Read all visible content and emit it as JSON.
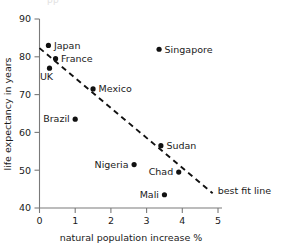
{
  "figure": {
    "ghost_text": "pp",
    "background": "#ffffff",
    "marker_color": "#111111",
    "axis_color": "#7a7a7a",
    "text_color": "#1a1a1a"
  },
  "chart_data": {
    "type": "scatter",
    "title": "",
    "xlabel": "natural population increase %",
    "ylabel": "life expectancy in years",
    "xlim": [
      0,
      5
    ],
    "ylim": [
      40,
      90
    ],
    "xticks": [
      "0",
      "1",
      "2",
      "3",
      "4",
      "5"
    ],
    "xtick_values": [
      0,
      1,
      2,
      3,
      4,
      5
    ],
    "yticks": [
      "40",
      "50",
      "60",
      "70",
      "80",
      "90"
    ],
    "ytick_values": [
      40,
      50,
      60,
      70,
      80,
      90
    ],
    "grid": false,
    "legend": "none",
    "points": [
      {
        "label": "Japan",
        "x": 0.25,
        "y": 83.0,
        "label_side": "right"
      },
      {
        "label": "France",
        "x": 0.45,
        "y": 79.5,
        "label_side": "right"
      },
      {
        "label": "UK",
        "x": 0.28,
        "y": 77.0,
        "label_side": "below"
      },
      {
        "label": "Mexico",
        "x": 1.5,
        "y": 71.5,
        "label_side": "right"
      },
      {
        "label": "Brazil",
        "x": 1.0,
        "y": 63.5,
        "label_side": "left"
      },
      {
        "label": "Singapore",
        "x": 3.35,
        "y": 82.0,
        "label_side": "right"
      },
      {
        "label": "Sudan",
        "x": 3.4,
        "y": 56.5,
        "label_side": "right"
      },
      {
        "label": "Nigeria",
        "x": 2.65,
        "y": 51.5,
        "label_side": "left"
      },
      {
        "label": "Chad",
        "x": 3.9,
        "y": 49.5,
        "label_side": "left"
      },
      {
        "label": "Mali",
        "x": 3.5,
        "y": 43.5,
        "label_side": "left"
      }
    ],
    "best_fit": {
      "label": "best fit line",
      "x_start": 0.0,
      "y_start": 82.3,
      "x_end": 4.85,
      "y_end": 43.9,
      "style": "dashed"
    }
  }
}
